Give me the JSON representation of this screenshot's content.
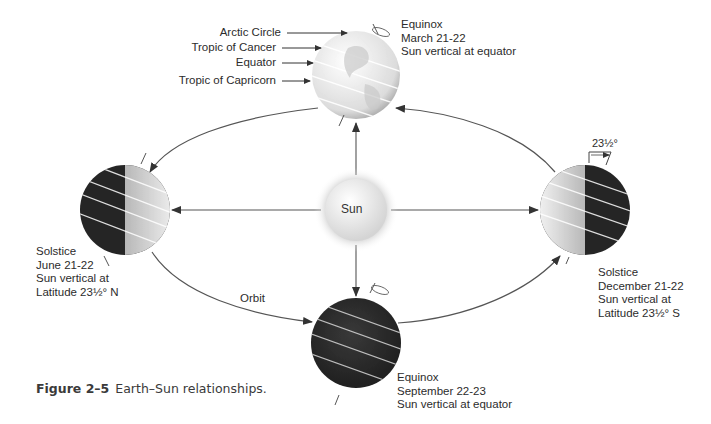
{
  "figure": {
    "number": "Figure 2–5",
    "caption": "Earth–Sun relationships."
  },
  "sun": {
    "label": "Sun"
  },
  "orbit": {
    "label": "Orbit"
  },
  "latitude_labels": [
    {
      "id": "arctic-circle",
      "label": "Arctic Circle"
    },
    {
      "id": "tropic-of-cancer",
      "label": "Tropic of Cancer"
    },
    {
      "id": "equator",
      "label": "Equator"
    },
    {
      "id": "tropic-of-capricorn",
      "label": "Tropic of Capricorn"
    }
  ],
  "positions": [
    {
      "id": "march",
      "lines": [
        "Equinox",
        "March 21-22",
        "Sun vertical at equator"
      ]
    },
    {
      "id": "june",
      "lines": [
        "Solstice",
        "June 21-22",
        "Sun vertical at",
        "Latitude 23½° N"
      ]
    },
    {
      "id": "september",
      "lines": [
        "Equinox",
        "September 22-23",
        "Sun vertical at equator"
      ]
    },
    {
      "id": "december",
      "lines": [
        "Solstice",
        "December 21-22",
        "Sun vertical at",
        "Latitude 23½° S"
      ]
    }
  ],
  "tilt_annotation": "23½°",
  "colors": {
    "line": "#555555",
    "globe_light": "#f2f2f2",
    "globe_dark": "#2b2b2b",
    "sun_glow": "#bdbdbd"
  }
}
